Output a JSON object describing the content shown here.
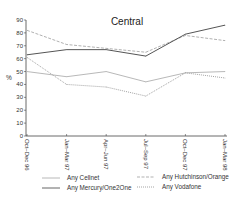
{
  "chart_data": {
    "type": "line",
    "title": "Central",
    "xlabel": "",
    "ylabel": "%",
    "ylim": [
      0,
      90
    ],
    "yticks": [
      0,
      10,
      20,
      30,
      40,
      50,
      60,
      70,
      80,
      90
    ],
    "categories": [
      "Oct–Dec 96",
      "Jan–Mar 97",
      "Apr–Jun 97",
      "Jul–Sep 97",
      "Oct–Dec 97",
      "Jan–Mar 98"
    ],
    "grid": false,
    "legend_position": "bottom",
    "series": [
      {
        "name": "Any Cellnet",
        "style": "solid",
        "color": "#b0b0b0",
        "values": [
          50,
          46,
          50,
          42,
          49,
          50
        ]
      },
      {
        "name": "Any Hutchinson/Orange",
        "style": "dashed",
        "color": "#a8a8a8",
        "values": [
          82,
          71,
          68,
          65,
          78,
          74
        ]
      },
      {
        "name": "Any Mercury/One2One",
        "style": "solid",
        "color": "#555555",
        "values": [
          63,
          67,
          67,
          62,
          79,
          86
        ]
      },
      {
        "name": "Any Vodafone",
        "style": "dotted",
        "color": "#9a9a9a",
        "values": [
          61,
          40,
          38,
          31,
          49,
          45
        ]
      }
    ]
  }
}
